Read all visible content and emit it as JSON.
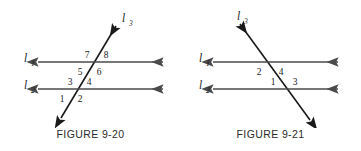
{
  "page": {
    "background_color": "#ffffff",
    "line_color": "#4a4a4a",
    "transversal_color": "#1a1a1a",
    "text_color": "#1a1a1a"
  },
  "figures": [
    {
      "id": "figure-9-20",
      "caption": "FIGURE 9-20",
      "lines": [
        {
          "name": "l1",
          "label": "l",
          "subscript": "1",
          "type": "horizontal",
          "arrows": "both"
        },
        {
          "name": "l2",
          "label": "l",
          "subscript": "2",
          "type": "horizontal",
          "arrows": "both"
        },
        {
          "name": "l3",
          "label": "l",
          "subscript": "3",
          "type": "transversal",
          "slope": "positive",
          "arrows": "both"
        }
      ],
      "angles": [
        {
          "number": "1",
          "position": "below-l2-left"
        },
        {
          "number": "2",
          "position": "below-l2-right"
        },
        {
          "number": "3",
          "position": "above-l2-left"
        },
        {
          "number": "4",
          "position": "above-l2-right"
        },
        {
          "number": "5",
          "position": "below-l1-left"
        },
        {
          "number": "6",
          "position": "below-l1-right"
        },
        {
          "number": "7",
          "position": "above-l1-left"
        },
        {
          "number": "8",
          "position": "above-l1-right"
        }
      ]
    },
    {
      "id": "figure-9-21",
      "caption": "FIGURE 9-21",
      "lines": [
        {
          "name": "l1",
          "label": "l",
          "subscript": "1",
          "type": "horizontal",
          "arrows": "both"
        },
        {
          "name": "l2",
          "label": "l",
          "subscript": "2",
          "type": "horizontal",
          "arrows": "both"
        },
        {
          "name": "l3",
          "label": "l",
          "subscript": "3",
          "type": "transversal",
          "slope": "negative",
          "arrows": "both"
        }
      ],
      "angles": [
        {
          "number": "2",
          "position": "below-l1-left"
        },
        {
          "number": "4",
          "position": "below-l1-right"
        },
        {
          "number": "1",
          "position": "above-l2-left"
        },
        {
          "number": "3",
          "position": "above-l2-right"
        }
      ]
    }
  ]
}
